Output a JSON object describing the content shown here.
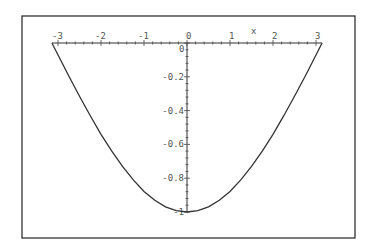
{
  "chart_data": {
    "type": "line",
    "title": "",
    "xlabel": "x",
    "ylabel": "",
    "xlim": [
      -3.14159,
      3.14159
    ],
    "ylim": [
      -1,
      0
    ],
    "grid": false,
    "legend": null,
    "x_ticks": [
      -3,
      -2,
      -1,
      0,
      1,
      2,
      3
    ],
    "x_tick_labels": [
      "-3",
      "-2",
      "-1",
      "0",
      "1",
      "2",
      "3"
    ],
    "y_ticks": [
      0,
      -0.2,
      -0.4,
      -0.6,
      -0.8,
      -1
    ],
    "y_tick_labels": [
      "0",
      "-0.2",
      "-0.4",
      "-0.6",
      "-0.8",
      "-1"
    ],
    "series": [
      {
        "name": "f(x)",
        "x": [
          -3.1416,
          -2.75,
          -2.5,
          -2.25,
          -2.0,
          -1.75,
          -1.5,
          -1.25,
          -1.0,
          -0.75,
          -0.5,
          -0.25,
          0,
          0.25,
          0.5,
          0.75,
          1.0,
          1.25,
          1.5,
          1.75,
          2.0,
          2.25,
          2.5,
          2.75,
          3.1416
        ],
        "y": [
          0,
          -0.195,
          -0.315,
          -0.43,
          -0.54,
          -0.64,
          -0.73,
          -0.81,
          -0.878,
          -0.93,
          -0.969,
          -0.992,
          -1,
          -0.992,
          -0.969,
          -0.93,
          -0.878,
          -0.81,
          -0.73,
          -0.64,
          -0.54,
          -0.43,
          -0.315,
          -0.195,
          0
        ]
      }
    ]
  },
  "labels": {
    "x_axis_name": "x",
    "origin_label": "0"
  },
  "colors": {
    "curve": "#333333",
    "axis": "#333333",
    "label": "#555555",
    "frame": "#222222",
    "background": "#ffffff"
  }
}
